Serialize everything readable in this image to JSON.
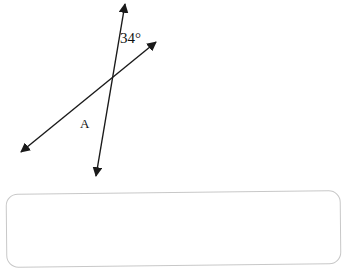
{
  "diagram": {
    "angle_label": "34°",
    "point_label": "A",
    "line_color": "#1a1a1a",
    "lines": [
      {
        "name": "line-steep",
        "x1": 125,
        "y1": 4,
        "x2": 96,
        "y2": 176
      },
      {
        "name": "line-shallow",
        "x1": 156,
        "y1": 42,
        "x2": 21,
        "y2": 152
      }
    ]
  },
  "answer_box": {
    "value": "",
    "border_color": "#c8c8c8"
  }
}
